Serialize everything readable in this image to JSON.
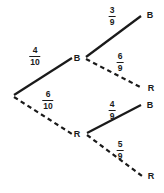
{
  "diagram": {
    "stroke_color": "#1a1a1a",
    "background_color": "#ffffff",
    "root": {
      "name": "root-node",
      "x": 13,
      "y": 96
    },
    "nodes": [
      {
        "id": "level1-b",
        "label": "B",
        "x": 77,
        "y": 58,
        "vertex_x": 85,
        "vertex_y": 58
      },
      {
        "id": "level1-r",
        "label": "R",
        "x": 77,
        "y": 134,
        "vertex_x": 86,
        "vertex_y": 134
      },
      {
        "id": "level2-bb",
        "label": "B",
        "x": 150,
        "y": 15
      },
      {
        "id": "level2-br",
        "label": "R",
        "x": 151,
        "y": 88
      },
      {
        "id": "level2-rb",
        "label": "B",
        "x": 150,
        "y": 105
      },
      {
        "id": "level2-rr",
        "label": "R",
        "x": 151,
        "y": 176
      }
    ],
    "branches": [
      {
        "id": "branch-root-b",
        "from": "root",
        "to": "level1-b",
        "style": "solid",
        "x1": 14,
        "y1": 95,
        "x2": 72,
        "y2": 58,
        "label": {
          "numerator": "4",
          "denominator": "10",
          "x": 35,
          "y": 56
        }
      },
      {
        "id": "branch-root-r",
        "from": "root",
        "to": "level1-r",
        "style": "dashed",
        "x1": 14,
        "y1": 97,
        "x2": 72,
        "y2": 134,
        "label": {
          "numerator": "6",
          "denominator": "10",
          "x": 48,
          "y": 100
        }
      },
      {
        "id": "branch-b-b",
        "from": "level1-b",
        "to": "level2-bb",
        "style": "solid",
        "x1": 86,
        "y1": 57,
        "x2": 141,
        "y2": 16,
        "label": {
          "numerator": "3",
          "denominator": "9",
          "x": 112,
          "y": 16
        }
      },
      {
        "id": "branch-b-r",
        "from": "level1-b",
        "to": "level2-br",
        "style": "dashed",
        "x1": 86,
        "y1": 59,
        "x2": 142,
        "y2": 88,
        "label": {
          "numerator": "6",
          "denominator": "9",
          "x": 120,
          "y": 62
        }
      },
      {
        "id": "branch-r-b",
        "from": "level1-r",
        "to": "level2-rb",
        "style": "solid",
        "x1": 87,
        "y1": 133,
        "x2": 141,
        "y2": 105,
        "label": {
          "numerator": "4",
          "denominator": "9",
          "x": 112,
          "y": 110
        }
      },
      {
        "id": "branch-r-r",
        "from": "level1-r",
        "to": "level2-rr",
        "style": "dashed",
        "x1": 87,
        "y1": 135,
        "x2": 142,
        "y2": 176,
        "label": {
          "numerator": "5",
          "denominator": "9",
          "x": 120,
          "y": 150
        }
      }
    ]
  }
}
